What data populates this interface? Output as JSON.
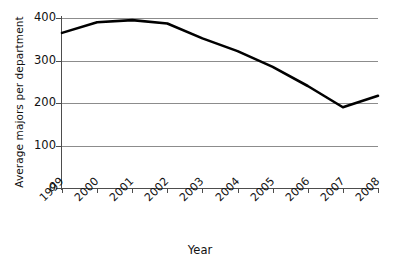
{
  "chart_data": {
    "type": "line",
    "title": "",
    "xlabel": "Year",
    "ylabel": "Average majors per department",
    "categories": [
      "1999",
      "2000",
      "2001",
      "2002",
      "2003",
      "2004",
      "2005",
      "2006",
      "2007",
      "2008"
    ],
    "x": [
      1999,
      2000,
      2001,
      2002,
      2003,
      2004,
      2005,
      2006,
      2007,
      2008
    ],
    "values": [
      365,
      390,
      395,
      387,
      352,
      322,
      285,
      240,
      190,
      217
    ],
    "series": [
      {
        "name": "Average majors per department",
        "values": [
          365,
          390,
          395,
          387,
          352,
          322,
          285,
          240,
          190,
          217
        ],
        "color": "#000000"
      }
    ],
    "ylim": [
      0,
      400
    ],
    "yticks": [
      0,
      100,
      200,
      300,
      400
    ],
    "ytick_labels": [
      "0",
      "100",
      "200",
      "300",
      "400"
    ],
    "grid": true,
    "grid_color": "#8c8c8c",
    "legend": false,
    "legend_position": "none",
    "axis_color": "#4d4d4d",
    "background": "#ffffff",
    "xtick_rotation": -45
  },
  "axes": {
    "y_title": "Average majors per department",
    "x_title": "Year"
  }
}
